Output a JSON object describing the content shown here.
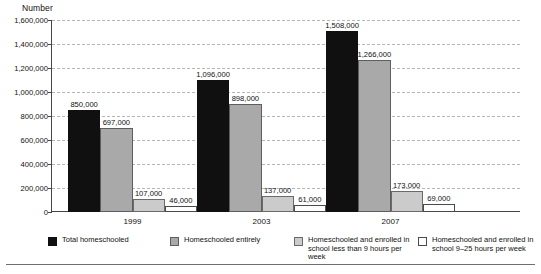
{
  "chart_data": {
    "type": "bar",
    "title": "",
    "ylabel": "Number",
    "xlabel": "",
    "categories": [
      "1999",
      "2003",
      "2007"
    ],
    "series": [
      {
        "name": "Total homeschooled",
        "color": "#101010",
        "values": [
          850000,
          1096000,
          1508000
        ],
        "labels": [
          "850,000",
          "1,096,000",
          "1,508,000"
        ]
      },
      {
        "name": "Homeschooled entirely",
        "color": "#a9a9a9",
        "values": [
          697000,
          898000,
          1266000
        ],
        "labels": [
          "697,000",
          "898,000",
          "1,266,000"
        ]
      },
      {
        "name": "Homeschooled and enrolled in school less than 9 hours per week",
        "color": "#cbcbcb",
        "values": [
          107000,
          137000,
          173000
        ],
        "labels": [
          "107,000",
          "137,000",
          "173,000"
        ]
      },
      {
        "name": "Homeschooled and enrolled in school 9–25 hours per week",
        "color": "#ffffff",
        "values": [
          46000,
          61000,
          69000
        ],
        "labels": [
          "46,000",
          "61,000",
          "69,000"
        ]
      }
    ],
    "ylim": [
      0,
      1600000
    ],
    "yticks": [
      0,
      200000,
      400000,
      600000,
      800000,
      1000000,
      1200000,
      1400000,
      1600000
    ],
    "ytick_labels": [
      "0",
      "200,000",
      "400,000",
      "600,000",
      "800,000",
      "1,000,000",
      "1,200,000",
      "1,400,000",
      "1,600,000"
    ],
    "grid": true,
    "legend_position": "bottom"
  },
  "legend": {
    "items": [
      {
        "label": "Total homeschooled"
      },
      {
        "label": "Homeschooled entirely"
      },
      {
        "label": "Homeschooled and enrolled in school less than 9 hours per week"
      },
      {
        "label": "Homeschooled and enrolled in school 9–25 hours per week"
      }
    ]
  }
}
